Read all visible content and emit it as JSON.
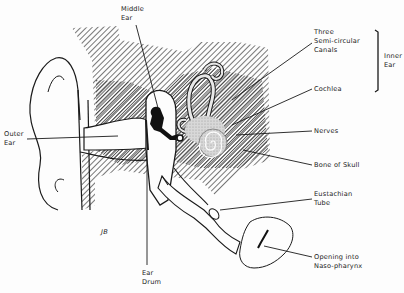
{
  "diagram": {
    "signature": "JB",
    "labels": {
      "middle_ear": [
        "Middle",
        "Ear"
      ],
      "outer_ear": [
        "Outer",
        "Ear"
      ],
      "ear_drum": [
        "Ear",
        "Drum"
      ],
      "semicircular": [
        "Three",
        "Semi-circular",
        "Canals"
      ],
      "inner_ear": [
        "Inner",
        "Ear"
      ],
      "cochlea": "Cochlea",
      "nerves": "Nerves",
      "bone_of_skull": "Bone of Skull",
      "eustachian": [
        "Eustachian",
        "Tube"
      ],
      "opening": [
        "Opening into",
        "Naso-pharynx"
      ]
    },
    "colors": {
      "ink": "#1a1a1a",
      "hatch": "#555555",
      "background": "#fdfdfd"
    }
  }
}
